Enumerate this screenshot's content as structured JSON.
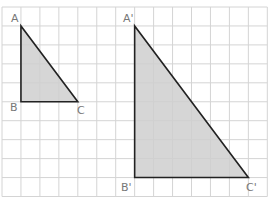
{
  "figure": {
    "grid": {
      "x0": 2,
      "y0": 7,
      "cell": 18.95,
      "cols": 14,
      "rows": 10,
      "line_color": "#d4d4d4"
    },
    "fill_color": "#cfcfcf",
    "stroke_color": "#222222",
    "triangles": [
      {
        "name": "ABC",
        "vertices": {
          "A": [
            1,
            1
          ],
          "B": [
            1,
            5
          ],
          "C": [
            4,
            5
          ]
        },
        "labels": {
          "A": "A",
          "B": "B",
          "C": "C"
        }
      },
      {
        "name": "A'B'C'",
        "vertices": {
          "A": [
            7,
            1
          ],
          "B": [
            7,
            9
          ],
          "C": [
            13,
            9
          ]
        },
        "labels": {
          "A": "A'",
          "B": "B'",
          "C": "C'"
        }
      }
    ]
  }
}
